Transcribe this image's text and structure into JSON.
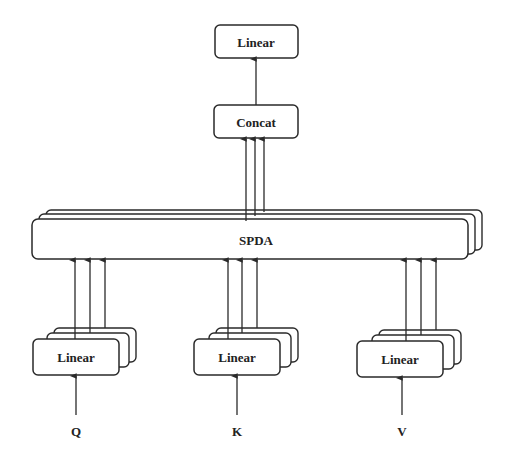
{
  "diagram": {
    "nodes": {
      "linear_out": {
        "label": "Linear"
      },
      "concat": {
        "label": "Concat"
      },
      "spda": {
        "label": "SPDA",
        "stack_count": 3
      },
      "linear_q": {
        "label": "Linear",
        "stack_count": 3
      },
      "linear_k": {
        "label": "Linear",
        "stack_count": 3
      },
      "linear_v": {
        "label": "Linear",
        "stack_count": 3
      }
    },
    "inputs": {
      "q": "Q",
      "k": "K",
      "v": "V"
    },
    "edges": [
      {
        "from": "Q",
        "to": "linear_q"
      },
      {
        "from": "K",
        "to": "linear_k"
      },
      {
        "from": "V",
        "to": "linear_v"
      },
      {
        "from": "linear_q",
        "to": "spda",
        "count": 3
      },
      {
        "from": "linear_k",
        "to": "spda",
        "count": 3
      },
      {
        "from": "linear_v",
        "to": "spda",
        "count": 3
      },
      {
        "from": "spda",
        "to": "concat",
        "count": 3
      },
      {
        "from": "concat",
        "to": "linear_out"
      }
    ],
    "colors": {
      "stroke": "#2a2a2a",
      "fill": "#ffffff",
      "text": "#222222"
    }
  }
}
